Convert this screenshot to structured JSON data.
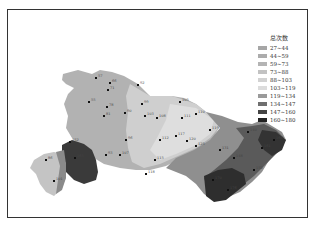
{
  "legend": {
    "title": "总次数",
    "items": [
      {
        "label": "27~44",
        "color": "#a6a6a6"
      },
      {
        "label": "44~59",
        "color": "#acacac"
      },
      {
        "label": "59~73",
        "color": "#b4b4b4"
      },
      {
        "label": "73~88",
        "color": "#c2c2c2"
      },
      {
        "label": "88~103",
        "color": "#d2d2d2"
      },
      {
        "label": "103~119",
        "color": "#dcdcdc"
      },
      {
        "label": "119~134",
        "color": "#9a9a9a"
      },
      {
        "label": "134~147",
        "color": "#6f6f6f"
      },
      {
        "label": "147~160",
        "color": "#444444"
      },
      {
        "label": "160~180",
        "color": "#222222"
      }
    ]
  },
  "stations": [
    {
      "x": 96,
      "y": 78,
      "label": "57"
    },
    {
      "x": 110,
      "y": 83,
      "label": "66"
    },
    {
      "x": 108,
      "y": 90,
      "label": "71"
    },
    {
      "x": 89,
      "y": 102,
      "label": "55"
    },
    {
      "x": 107,
      "y": 107,
      "label": "78"
    },
    {
      "x": 104,
      "y": 116,
      "label": "81"
    },
    {
      "x": 125,
      "y": 113,
      "label": "90"
    },
    {
      "x": 138,
      "y": 85,
      "label": "92"
    },
    {
      "x": 142,
      "y": 104,
      "label": "99"
    },
    {
      "x": 145,
      "y": 116,
      "label": "103"
    },
    {
      "x": 157,
      "y": 118,
      "label": "108"
    },
    {
      "x": 182,
      "y": 118,
      "label": "111"
    },
    {
      "x": 176,
      "y": 136,
      "label": "117"
    },
    {
      "x": 187,
      "y": 141,
      "label": "120"
    },
    {
      "x": 196,
      "y": 146,
      "label": "125"
    },
    {
      "x": 210,
      "y": 130,
      "label": "119"
    },
    {
      "x": 220,
      "y": 150,
      "label": "131"
    },
    {
      "x": 234,
      "y": 158,
      "label": "148"
    },
    {
      "x": 248,
      "y": 132,
      "label": "140"
    },
    {
      "x": 262,
      "y": 148,
      "label": "161"
    },
    {
      "x": 274,
      "y": 140,
      "label": "166"
    },
    {
      "x": 254,
      "y": 170,
      "label": "152"
    },
    {
      "x": 213,
      "y": 180,
      "label": "170"
    },
    {
      "x": 228,
      "y": 190,
      "label": "176"
    },
    {
      "x": 160,
      "y": 140,
      "label": "112"
    },
    {
      "x": 155,
      "y": 160,
      "label": "115"
    },
    {
      "x": 146,
      "y": 174,
      "label": "118"
    },
    {
      "x": 126,
      "y": 140,
      "label": "96"
    },
    {
      "x": 106,
      "y": 155,
      "label": "93"
    },
    {
      "x": 120,
      "y": 155,
      "label": "107"
    },
    {
      "x": 70,
      "y": 142,
      "label": "152"
    },
    {
      "x": 75,
      "y": 158,
      "label": "165"
    },
    {
      "x": 46,
      "y": 160,
      "label": "86"
    },
    {
      "x": 54,
      "y": 181,
      "label": "101"
    },
    {
      "x": 180,
      "y": 102,
      "label": "105"
    },
    {
      "x": 196,
      "y": 114,
      "label": "110"
    }
  ]
}
